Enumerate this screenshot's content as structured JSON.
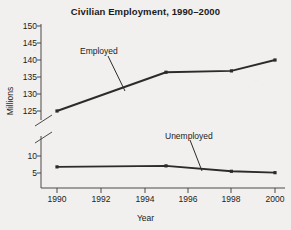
{
  "chart_data": {
    "type": "line",
    "title": "Civilian Employment, 1990–2000",
    "xlabel": "Year",
    "ylabel": "Millions",
    "grid": false,
    "legend_position": "inline-annotation",
    "broken_axis": true,
    "x": [
      1990,
      1995,
      1998,
      2000
    ],
    "xlim": [
      1990,
      2000
    ],
    "xticks": [
      1990,
      1992,
      1994,
      1996,
      1998,
      2000
    ],
    "xtick_labels": [
      "1990",
      "1992",
      "1994",
      "1996",
      "1998",
      "2000"
    ],
    "yticks_upper": [
      125,
      130,
      135,
      140,
      145,
      150
    ],
    "ytick_labels_upper": [
      "125",
      "130",
      "135",
      "140",
      "145",
      "150"
    ],
    "yticks_lower": [
      5,
      10
    ],
    "ytick_labels_lower": [
      "5",
      "10"
    ],
    "ylim_upper": [
      125,
      150
    ],
    "ylim_lower": [
      0,
      12
    ],
    "series": [
      {
        "name": "Employed",
        "values": [
          125.0,
          136.4,
          136.8,
          140.0
        ],
        "axis": "upper"
      },
      {
        "name": "Unemployed",
        "values": [
          6.8,
          7.1,
          5.5,
          5.1
        ],
        "axis": "lower"
      }
    ],
    "annotations": [
      {
        "text": "Employed",
        "series": "Employed"
      },
      {
        "text": "Unemployed",
        "series": "Unemployed"
      }
    ]
  },
  "ytick_labels": [
    "150",
    "145",
    "140",
    "135",
    "130",
    "125",
    "10",
    "5"
  ],
  "xtick_labels": [
    "1990",
    "1992",
    "1994",
    "1996",
    "1998",
    "2000"
  ],
  "labels": {
    "employed": "Employed",
    "unemployed": "Unemployed"
  },
  "colors": {
    "line": "#2b2b2b",
    "axis": "#4a4a4a",
    "text": "#1b1b1b",
    "background": "#f1f0ee"
  }
}
